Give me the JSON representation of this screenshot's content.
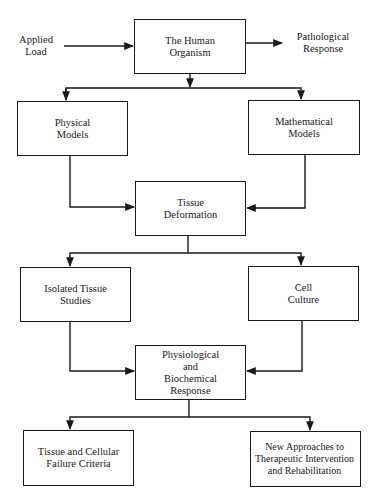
{
  "diagram": {
    "inputs": {
      "applied_load": "Applied\nLoad"
    },
    "outputs": {
      "pathological_response": "Pathological\nResponse"
    },
    "nodes": {
      "human_organism": "The Human\nOrganism",
      "physical_models": "Physical\nModels",
      "mathematical_models": "Mathematical\nModels",
      "tissue_deformation": "Tissue\nDeformation",
      "isolated_tissue_studies": "Isolated Tissue\nStudies",
      "cell_culture": "Cell\nCulture",
      "physiological_response": "Physiological\nand\nBiochemical\nResponse",
      "failure_criteria": "Tissue and Cellular\nFailure Criteria",
      "new_approaches": "New Approaches to\nTherapeutic Intervention\nand Rehabilitation"
    },
    "edges": [
      {
        "from": "Applied Load",
        "to": "The Human Organism"
      },
      {
        "from": "The Human Organism",
        "to": "Pathological Response"
      },
      {
        "from": "The Human Organism",
        "to": "Physical Models"
      },
      {
        "from": "The Human Organism",
        "to": "Mathematical Models"
      },
      {
        "from": "Physical Models",
        "to": "Tissue Deformation"
      },
      {
        "from": "Mathematical Models",
        "to": "Tissue Deformation"
      },
      {
        "from": "Tissue Deformation",
        "to": "Isolated Tissue Studies"
      },
      {
        "from": "Tissue Deformation",
        "to": "Cell Culture"
      },
      {
        "from": "Isolated Tissue Studies",
        "to": "Physiological and Biochemical Response"
      },
      {
        "from": "Cell Culture",
        "to": "Physiological and Biochemical Response"
      },
      {
        "from": "Physiological and Biochemical Response",
        "to": "Tissue and Cellular Failure Criteria"
      },
      {
        "from": "Physiological and Biochemical Response",
        "to": "New Approaches to Therapeutic Intervention and Rehabilitation"
      }
    ],
    "line_color": "#1a1a1a"
  }
}
